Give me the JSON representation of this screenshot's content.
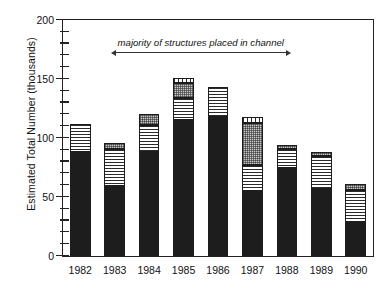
{
  "chart_data": {
    "type": "bar",
    "title": "",
    "xlabel": "",
    "ylabel": "Estimated Total Number (thousands)",
    "ylim": [
      0,
      200
    ],
    "ytick_values": [
      0,
      50,
      100,
      150,
      200
    ],
    "ytick_labels": [
      "0",
      "50",
      "100",
      "150",
      "200"
    ],
    "yminor_interval": 10,
    "grid": false,
    "legend": null,
    "stacked": true,
    "categories": [
      "1982",
      "1983",
      "1984",
      "1985",
      "1986",
      "1987",
      "1988",
      "1989",
      "1990"
    ],
    "series": [
      {
        "name": "solid-black",
        "pattern": "solid",
        "values": [
          88,
          59,
          88,
          115,
          118,
          55,
          75,
          57,
          29
        ]
      },
      {
        "name": "horizontal-stripe",
        "pattern": "stripe",
        "values": [
          24,
          32,
          23,
          19,
          25,
          22,
          16,
          28,
          27
        ]
      },
      {
        "name": "checkered-grey",
        "pattern": "check",
        "values": [
          0,
          5,
          9,
          13,
          0,
          36,
          3,
          3,
          5
        ]
      },
      {
        "name": "dotted",
        "pattern": "dots",
        "values": [
          0,
          0,
          0,
          4,
          0,
          5,
          0,
          0,
          0
        ]
      }
    ],
    "totals": [
      112,
      96,
      120,
      151,
      143,
      118,
      94,
      88,
      61
    ],
    "annotations": [
      {
        "text": "majority of structures placed in channel",
        "style": "italic",
        "span_from": "1983",
        "span_to": "1988",
        "y_value": 172
      }
    ]
  }
}
